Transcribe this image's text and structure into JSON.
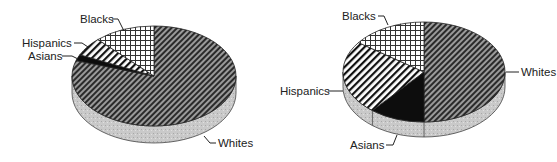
{
  "chart_data": [
    {
      "type": "pie",
      "style": "3d",
      "title": "",
      "categories": [
        "Whites",
        "Blacks",
        "Hispanics",
        "Asians"
      ],
      "values": [
        80,
        12,
        6,
        2
      ],
      "unit": "percent (estimated)",
      "labels": {
        "Whites": "Whites",
        "Blacks": "Blacks",
        "Hispanics": "Hispanics",
        "Asians": "Asians"
      },
      "legend": "none (leader-line labels)"
    },
    {
      "type": "pie",
      "style": "3d",
      "title": "",
      "categories": [
        "Whites",
        "Asians",
        "Hispanics",
        "Blacks"
      ],
      "values": [
        50,
        11,
        24,
        15
      ],
      "unit": "percent (estimated)",
      "labels": {
        "Whites": "Whites",
        "Blacks": "Blacks",
        "Hispanics": "Hispanics",
        "Asians": "Asians"
      },
      "legend": "none (leader-line labels)"
    }
  ],
  "patterns": {
    "Whites": "dense-diagonal-hatch",
    "Blacks": "crosshatch-grid",
    "Hispanics": "bold-diagonal-hatch",
    "Asians": "solid-black"
  },
  "colors": {
    "side": "#c9c9c9",
    "ink": "#1a1a1a",
    "background": "#ffffff"
  },
  "left_chart": {
    "label_whites": "Whites",
    "label_blacks": "Blacks",
    "label_hispanics": "Hispanics",
    "label_asians": "Asians"
  },
  "right_chart": {
    "label_whites": "Whites",
    "label_blacks": "Blacks",
    "label_hispanics": "Hispanics",
    "label_asians": "Asians"
  }
}
